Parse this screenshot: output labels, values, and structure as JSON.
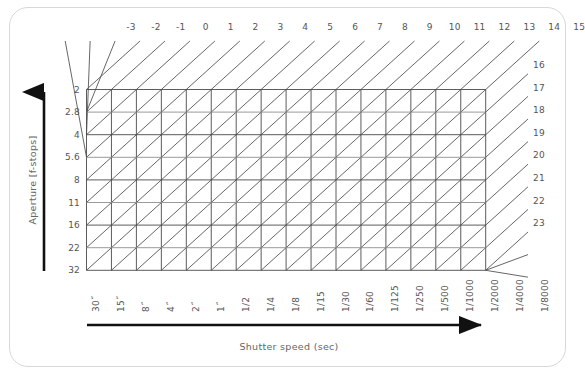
{
  "chart_data": {
    "type": "table",
    "title": "",
    "subtitle": "",
    "xlabel": "Shutter speed (sec)",
    "ylabel": "Aperture [f-stops]",
    "grid": true,
    "legend": "none",
    "x_categories": [
      "30˝",
      "15˝",
      "8˝",
      "4˝",
      "2˝",
      "1˝",
      "1/2",
      "1/4",
      "1/8",
      "1/15",
      "1/30",
      "1/60",
      "1/125",
      "1/250",
      "1/500",
      "1/1000",
      "1/2000",
      "1/4000",
      "1/8000"
    ],
    "x_tick_labels": [
      "30˝",
      "15˝",
      "8˝",
      "4˝",
      "2˝",
      "1˝",
      "1/2",
      "1/4",
      "1/8",
      "1/15",
      "1/30",
      "1/60",
      "1/125",
      "1/250",
      "1/500",
      "1/1000",
      "1/2000",
      "1/4000",
      "1/8000"
    ],
    "y_tick_labels": [
      "2",
      "2.8",
      "4",
      "5.6",
      "8",
      "11",
      "16",
      "22",
      "32"
    ],
    "diagonal_labels_top": [
      "-3",
      "-2",
      "-1",
      "0",
      "1",
      "2",
      "3",
      "4",
      "5",
      "6",
      "7",
      "8",
      "9",
      "10",
      "11",
      "12",
      "13",
      "14",
      "15"
    ],
    "diagonal_labels_right": [
      "16",
      "17",
      "18",
      "19",
      "20",
      "21",
      "22",
      "23"
    ],
    "columns": 16,
    "rows": 8,
    "ev_range": [
      -3,
      23
    ]
  },
  "card": {
    "border_color": "#d8d8d8"
  },
  "axes": {
    "x_title": "Shutter speed (sec)",
    "y_title": "Aperture [f-stops]",
    "x_tick_labels": [
      "30˝",
      "15˝",
      "8˝",
      "4˝",
      "2˝",
      "1˝",
      "1/2",
      "1/4",
      "1/8",
      "1/15",
      "1/30",
      "1/60",
      "1/125",
      "1/250",
      "1/500",
      "1/1000",
      "1/2000",
      "1/4000",
      "1/8000"
    ],
    "y_tick_labels": [
      "2",
      "2.8",
      "4",
      "5.6",
      "8",
      "11",
      "16",
      "22",
      "32"
    ],
    "arrow_color": "#111111"
  },
  "diagonals": {
    "top_labels": [
      "-3",
      "-2",
      "-1",
      "0",
      "1",
      "2",
      "3",
      "4",
      "5",
      "6",
      "7",
      "8",
      "9",
      "10",
      "11",
      "12",
      "13",
      "14",
      "15"
    ],
    "right_labels": [
      "16",
      "17",
      "18",
      "19",
      "20",
      "21",
      "22",
      "23"
    ],
    "line_color": "#555555"
  },
  "grid": {
    "line_color": "#4a4a4a",
    "light_line_color": "#8f8f8f"
  }
}
